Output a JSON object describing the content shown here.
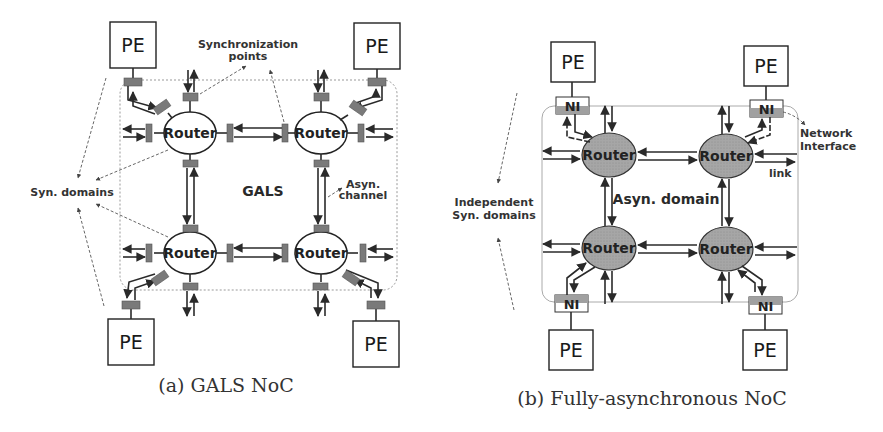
{
  "figure_a": {
    "caption": "(a) GALS NoC",
    "pe_label": "PE",
    "router_label": "Router",
    "center_label": "GALS",
    "annotations": {
      "sync_points_line1": "Synchronization",
      "sync_points_line2": "points",
      "syn_domains": "Syn. domains",
      "asyn_channel_line1": "Asyn.",
      "asyn_channel_line2": "channel"
    }
  },
  "figure_b": {
    "caption": "(b) Fully-asynchronous NoC",
    "pe_label": "PE",
    "router_label": "Router",
    "ni_label": "NI",
    "center_label": "Asyn. domain",
    "annotations": {
      "independent_line1": "Independent",
      "independent_line2": "Syn. domains",
      "network_interface_line1": "Network",
      "network_interface_line2": "Interface",
      "link": "link"
    }
  },
  "colors": {
    "router_fill_b": "#a8a8a8",
    "sync_point": "#7a7a7a",
    "ni_fill": "#a0a0a0"
  }
}
